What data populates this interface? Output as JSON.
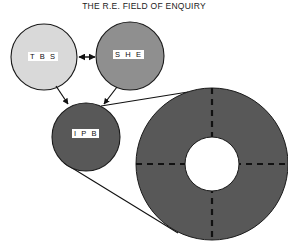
{
  "figure": {
    "title": "THE R.E. FIELD OF ENQUIRY",
    "background_color": "#ffffff",
    "width": 288,
    "height": 249
  },
  "nodes": [
    {
      "id": "tbs",
      "label": "T B S",
      "cx": 44,
      "cy": 57,
      "r": 33,
      "fill": "#d9d9d9",
      "stroke": "#1a1a1a",
      "label_x": 28,
      "label_y": 52
    },
    {
      "id": "she",
      "label": "S H E",
      "cx": 130,
      "cy": 56,
      "r": 34,
      "fill": "#8f8f8f",
      "stroke": "#1a1a1a",
      "label_x": 113,
      "label_y": 50
    },
    {
      "id": "ipb",
      "label": "I P B",
      "cx": 86,
      "cy": 137,
      "r": 34,
      "fill": "#585858",
      "stroke": "#1a1a1a",
      "label_x": 72,
      "label_y": 129
    }
  ],
  "annulus": {
    "id": "field-annulus",
    "cx": 212,
    "cy": 164,
    "outer_r": 76,
    "inner_r": 27,
    "fill": "#585858",
    "stroke": "#1a1a1a",
    "divider_style": "dashed",
    "divider_color": "#111111"
  },
  "connectors": [
    {
      "id": "tbs-she-link",
      "type": "double-arrow",
      "from": "tbs",
      "to": "she"
    },
    {
      "id": "tbs-ipb-link",
      "type": "arrow",
      "from": "tbs",
      "to": "ipb"
    },
    {
      "id": "she-ipb-link",
      "type": "arrow",
      "from": "she",
      "to": "ipb"
    },
    {
      "id": "ipb-annulus-upper-leader",
      "type": "line",
      "from": "ipb",
      "to": "field-annulus"
    },
    {
      "id": "ipb-annulus-lower-leader",
      "type": "line",
      "from": "ipb",
      "to": "field-annulus"
    }
  ]
}
